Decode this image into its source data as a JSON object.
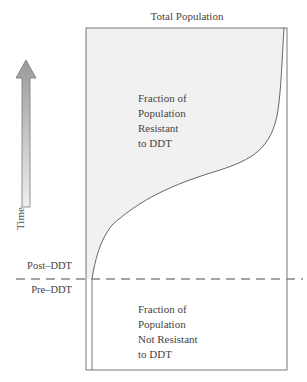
{
  "title": "Total Population",
  "axis": {
    "time_label": "Time",
    "arrow_direction": "up"
  },
  "divider": {
    "post_label": "Post–DDT",
    "pre_label": "Pre–DDT"
  },
  "regions": {
    "resistant": [
      "Fraction of",
      "Population",
      "Resistant",
      "to DDT"
    ],
    "not_resistant": [
      "Fraction of",
      "Population",
      "Not Resistant",
      "to DDT"
    ]
  },
  "colors": {
    "shade": "#f1f1f1",
    "arrow_top": "#9a9a9a",
    "arrow_bottom": "#ececec",
    "line": "#777777"
  }
}
